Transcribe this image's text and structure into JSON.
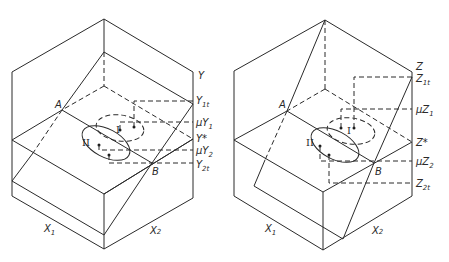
{
  "figure": {
    "panels": [
      {
        "id": "left",
        "axis_label": "Y",
        "labels": {
          "point_a": "A",
          "point_b": "B",
          "axis_x1": "X",
          "axis_x1_sub": "1",
          "axis_x2": "X",
          "axis_x2_sub": "2",
          "region_1": "I",
          "region_2": "II",
          "axis_top": "Y",
          "level_1t": "Y",
          "level_1t_sub": "1t",
          "level_mu1": "μY",
          "level_mu1_sub": "1",
          "level_star": "Y*",
          "level_mu2": "μY",
          "level_mu2_sub": "2",
          "level_2t": "Y",
          "level_2t_sub": "2t"
        }
      },
      {
        "id": "right",
        "axis_label": "Z",
        "labels": {
          "point_a": "A",
          "point_b": "B",
          "axis_x1": "X",
          "axis_x1_sub": "1",
          "axis_x2": "X",
          "axis_x2_sub": "2",
          "region_1": "I",
          "region_2": "II",
          "axis_top": "Z",
          "level_1t": "Z",
          "level_1t_sub": "1t",
          "level_mu1": "μZ",
          "level_mu1_sub": "1",
          "level_star": "Z*",
          "level_mu2": "μZ",
          "level_mu2_sub": "2",
          "level_2t": "Z",
          "level_2t_sub": "2t"
        }
      }
    ]
  }
}
